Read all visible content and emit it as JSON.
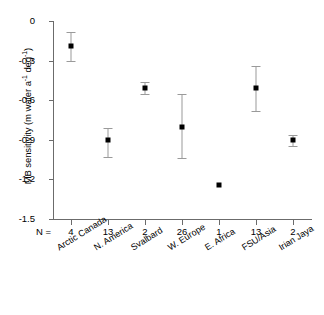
{
  "chart_data": {
    "type": "scatter",
    "title": "",
    "xlabel": "",
    "ylabel_plain": "MB sensitivity (m water a-1 deg-1)",
    "ylabel_parts": {
      "lead": "MB sensitivity (m water a",
      "sup1": "-1",
      "mid": " deg",
      "sup2": "-1",
      "tail": ")"
    },
    "categories": [
      "Arctic Canada",
      "N. America",
      "Svalbard",
      "W. Europe",
      "E. Africa",
      "FSU/Asia",
      "Irian Jaya"
    ],
    "n_label": "N =",
    "n_values": [
      4,
      13,
      2,
      26,
      1,
      13,
      2
    ],
    "values": [
      -0.19,
      -0.9,
      -0.51,
      -0.8,
      -1.24,
      -0.51,
      -0.9
    ],
    "err_low": [
      -0.3,
      -1.03,
      -0.55,
      -1.04,
      null,
      -0.68,
      -0.95
    ],
    "err_high": [
      -0.08,
      -0.81,
      -0.46,
      -0.55,
      null,
      -0.34,
      -0.86
    ],
    "ylim": [
      -1.5,
      0
    ],
    "yticks": [
      0,
      -0.3,
      -0.6,
      -0.9,
      -1.2,
      -1.5
    ],
    "ytick_labels": [
      "0",
      "-0.3",
      "-0.6",
      "-0.9",
      "-1.2",
      "-1.5"
    ],
    "grid": false,
    "legend": "none",
    "marker_color": "#000000",
    "errorbar_color": "#9a9a9a",
    "axis_color": "#6b6b6b"
  }
}
